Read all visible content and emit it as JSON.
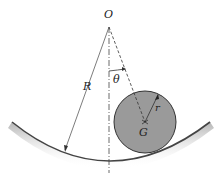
{
  "diagram": {
    "labels": {
      "origin": "O",
      "big_radius": "R",
      "angle": "θ",
      "small_radius": "r",
      "center_of_mass": "G"
    },
    "colors": {
      "disk_fill": "#9a9a9a",
      "disk_stroke": "#333333",
      "surface": "#555555",
      "line": "#333333"
    }
  }
}
